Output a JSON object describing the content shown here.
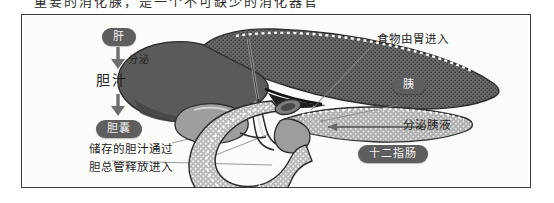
{
  "caption": {
    "text": "重要的消化腺，是一个不可缺少的消化器官"
  },
  "figure": {
    "background_color": "#fbfbfa",
    "border_color": "#3d3d3d",
    "pill_color": "#5e5e5e",
    "pill_text_color": "#f2f2f2"
  },
  "labels": {
    "liver": "肝",
    "secretes": "分泌",
    "bile": "胆汁",
    "gallbladder": "胆囊",
    "stored_bile_line1": "储存的胆汁通过",
    "stored_bile_line2": "胆总管释放进入",
    "food_from_stomach": "食物由胃进入",
    "pancreas": "胰",
    "pancreatic_juice": "分泌胰液",
    "duodenum": "十二指肠"
  },
  "anatomy": {
    "parts": [
      {
        "name": "liver",
        "label": "肝",
        "fill": "#6d6d6d"
      },
      {
        "name": "gallbladder",
        "label": "胆囊",
        "fill": "#a8a8a8"
      },
      {
        "name": "pancreas",
        "label": "胰",
        "fill": "#a3a3a3"
      },
      {
        "name": "duodenum",
        "label": "十二指肠",
        "fill": "#b5b5b5"
      },
      {
        "name": "bile-duct",
        "label": "胆总管",
        "fill": "#7a7a7a"
      }
    ]
  }
}
